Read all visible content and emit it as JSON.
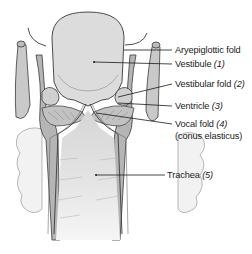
{
  "diagram": {
    "labels": [
      {
        "id": "aryepiglottic-fold",
        "text": "Aryepiglottic fold",
        "number": ""
      },
      {
        "id": "vestibule",
        "text": "Vestibule",
        "number": "(1)"
      },
      {
        "id": "vestibular-fold",
        "text": "Vestibular fold",
        "number": "(2)"
      },
      {
        "id": "ventricle",
        "text": "Ventricle",
        "number": "(3)"
      },
      {
        "id": "vocal-fold",
        "text": "Vocal fold",
        "number": "(4)"
      },
      {
        "id": "conus-elasticus",
        "text": "(conus elasticus)",
        "number": ""
      },
      {
        "id": "trachea",
        "text": "Trachea",
        "number": "(5)"
      }
    ],
    "colors": {
      "background": "#ffffff",
      "lumen": "#dcdcdc",
      "tissue": "#b8b8b8",
      "outline": "#3a3a3a",
      "text": "#1a1a1a"
    }
  }
}
